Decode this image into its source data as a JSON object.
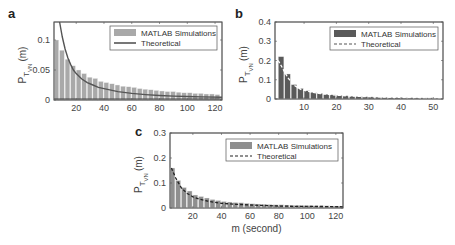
{
  "chart_data": [
    {
      "id": "a",
      "type": "bar",
      "panel_label": "a",
      "title": "",
      "xlabel": "",
      "ylabel": "P_T_VN (m)",
      "xlim": [
        4,
        125
      ],
      "ylim": [
        0,
        0.13
      ],
      "xticks": [
        20,
        40,
        60,
        80,
        100,
        120
      ],
      "yticks": [
        0,
        0.05,
        0.1
      ],
      "ytick_labels": [
        "0",
        "0.05",
        "0.1"
      ],
      "legend": [
        "MATLAB Simulations",
        "Theoretical"
      ],
      "legend_position": "upper right",
      "bar_color": "#a9a9a9",
      "line_color": "#555555",
      "line_style": "solid",
      "bar_width": 4,
      "x": [
        6,
        10,
        14,
        18,
        22,
        26,
        30,
        34,
        38,
        42,
        46,
        50,
        54,
        58,
        62,
        66,
        70,
        74,
        78,
        82,
        86,
        90,
        94,
        98,
        102,
        106,
        110,
        114,
        118,
        122
      ],
      "series": [
        {
          "name": "MATLAB Simulations",
          "values": [
            0.1,
            0.083,
            0.068,
            0.057,
            0.05,
            0.044,
            0.038,
            0.036,
            0.031,
            0.029,
            0.027,
            0.025,
            0.023,
            0.022,
            0.021,
            0.019,
            0.018,
            0.017,
            0.016,
            0.015,
            0.014,
            0.014,
            0.013,
            0.012,
            0.012,
            0.011,
            0.011,
            0.01,
            0.01,
            0.009
          ]
        },
        {
          "name": "Theoretical",
          "x": [
            8,
            10,
            12,
            14,
            16,
            18,
            20,
            24,
            28,
            32,
            36,
            40,
            50,
            60,
            70,
            80,
            90,
            100,
            110,
            125
          ],
          "values": [
            0.13,
            0.105,
            0.085,
            0.07,
            0.059,
            0.05,
            0.044,
            0.035,
            0.029,
            0.025,
            0.021,
            0.019,
            0.014,
            0.011,
            0.009,
            0.0075,
            0.0065,
            0.0058,
            0.0052,
            0.0045
          ]
        }
      ]
    },
    {
      "id": "b",
      "type": "bar",
      "panel_label": "b",
      "title": "",
      "xlabel": "",
      "ylabel": "P_T_VN (m)",
      "xlim": [
        1,
        53
      ],
      "ylim": [
        0,
        0.4
      ],
      "xticks": [
        10,
        20,
        30,
        40,
        50
      ],
      "yticks": [
        0,
        0.1,
        0.2,
        0.3,
        0.4
      ],
      "ytick_labels": [
        "0",
        "0.1",
        "0.2",
        "0.3",
        "0.4"
      ],
      "legend": [
        "MATLAB Simulations",
        "Theoretical"
      ],
      "legend_position": "upper right",
      "bar_color": "#5a5a5a",
      "line_color": "#ffffff",
      "line_style": "dashed",
      "bar_width": 2,
      "x": [
        3,
        5,
        7,
        9,
        11,
        13,
        15,
        17,
        19,
        21,
        23,
        25,
        27,
        29,
        31,
        33,
        35,
        37,
        39,
        41,
        43,
        45,
        47,
        49,
        51
      ],
      "series": [
        {
          "name": "MATLAB Simulations",
          "values": [
            0.22,
            0.13,
            0.075,
            0.055,
            0.043,
            0.035,
            0.029,
            0.025,
            0.022,
            0.019,
            0.017,
            0.015,
            0.013,
            0.012,
            0.011,
            0.01,
            0.009,
            0.008,
            0.008,
            0.007,
            0.007,
            0.006,
            0.006,
            0.006,
            0.005
          ]
        },
        {
          "name": "Theoretical",
          "x": [
            2,
            3,
            5,
            7,
            9,
            11,
            15,
            20,
            25,
            30,
            40,
            53
          ],
          "values": [
            0.2,
            0.17,
            0.11,
            0.07,
            0.05,
            0.04,
            0.028,
            0.02,
            0.015,
            0.012,
            0.008,
            0.005
          ]
        }
      ]
    },
    {
      "id": "c",
      "type": "bar",
      "panel_label": "c",
      "title": "",
      "xlabel": "m (second)",
      "ylabel": "P_T_VN (m)",
      "xlim": [
        4,
        125
      ],
      "ylim": [
        0,
        0.3
      ],
      "xticks": [
        20,
        40,
        60,
        80,
        100,
        120
      ],
      "yticks": [
        0,
        0.1,
        0.2,
        0.3
      ],
      "ytick_labels": [
        "0",
        "0.1",
        "0.2",
        "0.3"
      ],
      "legend": [
        "MATLAB Simulations",
        "Theoretical"
      ],
      "legend_position": "upper right",
      "bar_color": "#8f8f8f",
      "line_color": "#222222",
      "line_style": "dashed",
      "bar_width": 4,
      "x": [
        6,
        10,
        14,
        18,
        22,
        26,
        30,
        34,
        38,
        42,
        46,
        50,
        54,
        58,
        62,
        66,
        70,
        74,
        78,
        82,
        86,
        90,
        94,
        98,
        102,
        106,
        110,
        114,
        118,
        122
      ],
      "series": [
        {
          "name": "MATLAB Simulations",
          "values": [
            0.16,
            0.11,
            0.082,
            0.068,
            0.052,
            0.046,
            0.04,
            0.034,
            0.03,
            0.026,
            0.024,
            0.022,
            0.021,
            0.019,
            0.017,
            0.016,
            0.015,
            0.014,
            0.013,
            0.013,
            0.012,
            0.011,
            0.011,
            0.01,
            0.01,
            0.009,
            0.009,
            0.009,
            0.008,
            0.008
          ]
        },
        {
          "name": "Theoretical",
          "x": [
            5,
            8,
            12,
            16,
            20,
            25,
            30,
            35,
            40,
            50,
            60,
            70,
            80,
            90,
            100,
            110,
            125
          ],
          "values": [
            0.16,
            0.12,
            0.08,
            0.058,
            0.045,
            0.035,
            0.028,
            0.023,
            0.019,
            0.015,
            0.012,
            0.01,
            0.008,
            0.007,
            0.0065,
            0.006,
            0.005
          ]
        }
      ]
    }
  ],
  "labels": {
    "a": "a",
    "b": "b",
    "c": "c",
    "legend_sim": "MATLAB Simulations",
    "legend_theory": "Theoretical",
    "ylabel_main": "P",
    "ylabel_sub1": "T",
    "ylabel_sub2": "VN",
    "ylabel_arg": "(m)",
    "xlabel_c": "m (second)"
  }
}
